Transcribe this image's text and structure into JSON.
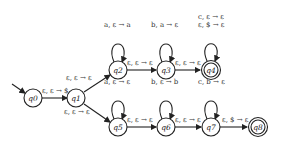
{
  "diagram": {
    "type": "pushdown-automaton",
    "states": [
      {
        "id": "q0",
        "label": "q0",
        "start": true,
        "accept": false
      },
      {
        "id": "q1",
        "label": "q1",
        "start": false,
        "accept": false
      },
      {
        "id": "q2",
        "label": "q2",
        "start": false,
        "accept": false
      },
      {
        "id": "q3",
        "label": "q3",
        "start": false,
        "accept": false
      },
      {
        "id": "q4",
        "label": "q4",
        "start": false,
        "accept": true
      },
      {
        "id": "q5",
        "label": "q5",
        "start": false,
        "accept": false
      },
      {
        "id": "q6",
        "label": "q6",
        "start": false,
        "accept": false
      },
      {
        "id": "q7",
        "label": "q7",
        "start": false,
        "accept": false
      },
      {
        "id": "q8",
        "label": "q8",
        "start": false,
        "accept": true
      }
    ],
    "transitions": {
      "q0_q1": "ε, ε → $",
      "q1_q2": "ε, ε → ε",
      "q1_q5": "ε, ε → ε",
      "q2_loop": "a, ε → a",
      "q2_q3": "ε, ε → ε",
      "q3_loop": "b, a → ε",
      "q3_q4": "ε, ε → ε",
      "q4_loop_1": "c, ε → ε",
      "q4_loop_2": "ε, $ → ε",
      "q5_loop": "a, ε → ε",
      "q5_q6": "ε, ε → ε",
      "q6_loop": "b, ε → b",
      "q6_q7": "ε, ε → ε",
      "q7_loop": "c, b → ε",
      "q7_q8": "ε, $ → ε"
    }
  }
}
